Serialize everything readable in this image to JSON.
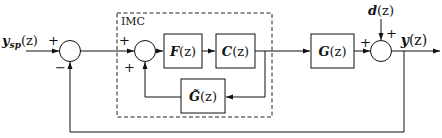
{
  "diagram": {
    "imc_label": "IMC",
    "input": {
      "symbol": "y",
      "subscript": "sp",
      "arg": "(z)"
    },
    "disturbance": {
      "symbol": "d",
      "arg": "(z)"
    },
    "output": {
      "symbol": "y",
      "arg": "(z)"
    },
    "blocks": {
      "F": {
        "symbol": "F",
        "arg": "(z)"
      },
      "C": {
        "symbol": "C",
        "arg": "(z)"
      },
      "G_model": {
        "symbol": "G̃",
        "arg": "(z)"
      },
      "G": {
        "symbol": "G",
        "arg": "(z)"
      }
    },
    "signs": {
      "sum1_top": "+",
      "sum1_bottom": "−",
      "sum2_top": "+",
      "sum2_bottom": "+",
      "sum3_left": "+",
      "sum3_top": "+"
    }
  }
}
